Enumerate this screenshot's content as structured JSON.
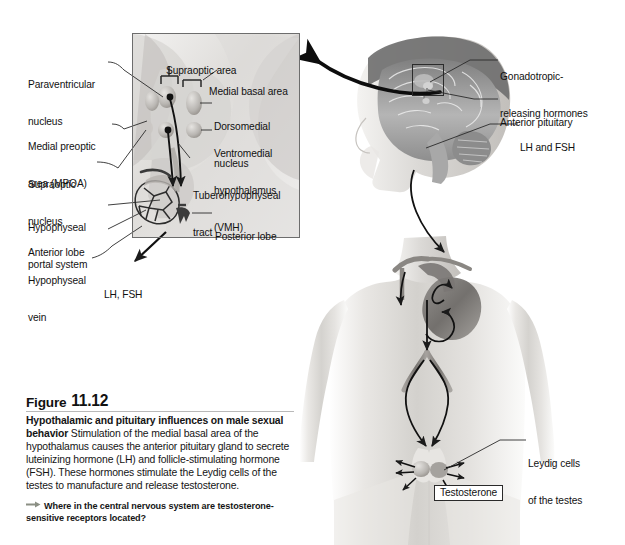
{
  "figure": {
    "label_word": "Figure",
    "number": "11.12",
    "title": "Hypothalamic and pituitary influences on male sexual behavior",
    "title_line1": "Hypothalamic and pituitary influences on male",
    "title_line2": "sexual behavior",
    "body": "Stimulation of the medial basal area of the hypothalamus causes the anterior pituitary gland to secrete luteinizing hormone (LH) and follicle-stimulating hormone (FSH). These hormones stimulate the Leydig cells of the testes to manufacture and release testosterone.",
    "question": "Where in the central nervous system are testosterone-sensitive receptors located?",
    "question_arrow_icon": "right-arrow-icon"
  },
  "inset": {
    "left_labels": [
      {
        "id": "paraventricular-nucleus",
        "line1": "Paraventricular",
        "line2": "nucleus"
      },
      {
        "id": "medial-preoptic-area",
        "line1": "Medial preoptic",
        "line2": "area (MPOA)"
      },
      {
        "id": "supraoptic-nucleus",
        "line1": "Supraoptic",
        "line2": "nucleus"
      },
      {
        "id": "hypophyseal-portal-system",
        "line1": "Hypophyseal",
        "line2": "portal system"
      },
      {
        "id": "anterior-lobe",
        "line1": "Anterior lobe",
        "line2": ""
      },
      {
        "id": "hypophyseal-vein",
        "line1": "Hypophyseal",
        "line2": "vein"
      }
    ],
    "inner_labels": [
      {
        "id": "supraoptic-area",
        "line1": "Supraoptic area",
        "line2": ""
      },
      {
        "id": "medial-basal-area",
        "line1": "Medial basal area",
        "line2": ""
      },
      {
        "id": "dorsomedial-nucleus",
        "line1": "Dorsomedial",
        "line2": "nucleus"
      },
      {
        "id": "ventromedial-hypothalamus",
        "line1": "Ventromedial",
        "line2": "hypothalamus",
        "line3": "(VMH)"
      },
      {
        "id": "tuberohypophyseal-tract",
        "line1": "Tuberohypophyseal",
        "line2": "tract"
      },
      {
        "id": "posterior-lobe",
        "line1": "Posterior lobe",
        "line2": ""
      }
    ],
    "outflow_label": "LH, FSH"
  },
  "body_figure": {
    "right_labels": [
      {
        "id": "gonadotropic-releasing-hormones",
        "line1": "Gonadotropic-",
        "line2": "releasing hormones"
      },
      {
        "id": "anterior-pituitary",
        "line1": "Anterior pituitary",
        "line2": ""
      },
      {
        "id": "lh-and-fsh",
        "line1": "LH and FSH",
        "line2": ""
      },
      {
        "id": "leydig-cells-of-the-testes",
        "line1": "Leydig cells",
        "line2": "of the testes"
      }
    ],
    "testosterone_label": "Testosterone"
  },
  "colors": {
    "rule": "#b9b9b9",
    "text": "#151515",
    "leader": "#2a2a2a",
    "inset_border": "#6d6d6d",
    "arrow_gray": "#8b8f84",
    "skin_light": "#efeeec",
    "skin_mid": "#d8d6d3",
    "skin_dark": "#b9b6b2",
    "vessel": "#6e6c6a",
    "brain_gray": "#9a9a9a"
  }
}
